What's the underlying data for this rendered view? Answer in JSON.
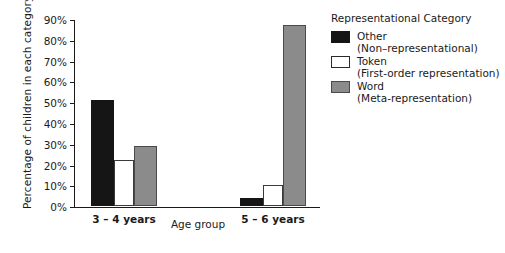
{
  "chart_data": {
    "type": "bar",
    "title": "",
    "xlabel": "Age group",
    "ylabel": "Percentage of children in each category",
    "categories": [
      "3 – 4 years",
      "5 – 6 years"
    ],
    "ylim": [
      0,
      90
    ],
    "ytick_labels": [
      "0%",
      "10%",
      "20%",
      "30%",
      "40%",
      "50%",
      "60%",
      "70%",
      "80%",
      "90%"
    ],
    "ytick_values": [
      0,
      10,
      20,
      30,
      40,
      50,
      60,
      70,
      80,
      90
    ],
    "grid": false,
    "legend_position": "right",
    "series": [
      {
        "name": "Other",
        "sublabel": "(Non–representational)",
        "color": "#151515",
        "values": [
          51,
          4
        ]
      },
      {
        "name": "Token",
        "sublabel": "(First-order representation)",
        "color": "#ffffff",
        "values": [
          22,
          10
        ]
      },
      {
        "name": "Word",
        "sublabel": "(Meta-representation)",
        "color": "#8b8b8b",
        "values": [
          29,
          87
        ]
      }
    ]
  },
  "legend": {
    "title": "Representational Category",
    "entries": [
      {
        "label": "Other",
        "sublabel": "(Non–representational)"
      },
      {
        "label": "Token",
        "sublabel": "(First-order representation)"
      },
      {
        "label": "Word",
        "sublabel": "(Meta-representation)"
      }
    ]
  },
  "axes": {
    "y_title": "Percentage of children in each category",
    "x_title": "Age group",
    "y_ticks": [
      "90%",
      "80%",
      "70%",
      "60%",
      "50%",
      "40%",
      "30%",
      "20%",
      "10%",
      "0%"
    ],
    "x_categories": [
      "3 – 4 years",
      "5 – 6 years"
    ]
  }
}
